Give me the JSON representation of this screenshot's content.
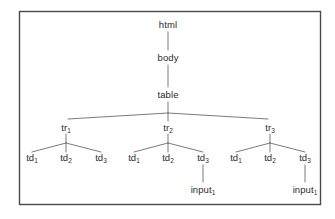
{
  "figure": {
    "type": "dom-tree-diagram",
    "title": "",
    "border_color": "#4a4a4a",
    "line_color": "#6b6b6b",
    "text_color": "#2b2b2b",
    "background": "#ffffff",
    "frame": {
      "x": 19,
      "y": 11,
      "width": 302,
      "height": 194
    }
  },
  "nodes": {
    "html": {
      "text": "html",
      "sub": "",
      "x": 168,
      "y": 25
    },
    "body": {
      "text": "body",
      "sub": "",
      "x": 168,
      "y": 58
    },
    "table": {
      "text": "table",
      "sub": "",
      "x": 168,
      "y": 95
    },
    "tr1": {
      "text": "tr",
      "sub": "1",
      "x": 66,
      "y": 128
    },
    "tr2": {
      "text": "tr",
      "sub": "2",
      "x": 168,
      "y": 128
    },
    "tr3": {
      "text": "tr",
      "sub": "3",
      "x": 270,
      "y": 128
    },
    "td11": {
      "text": "td",
      "sub": "1",
      "x": 32,
      "y": 158
    },
    "td12": {
      "text": "td",
      "sub": "2",
      "x": 66,
      "y": 158
    },
    "td13": {
      "text": "td",
      "sub": "3",
      "x": 101,
      "y": 158
    },
    "td21": {
      "text": "td",
      "sub": "1",
      "x": 134,
      "y": 158
    },
    "td22": {
      "text": "td",
      "sub": "2",
      "x": 168,
      "y": 158
    },
    "td23": {
      "text": "td",
      "sub": "3",
      "x": 203,
      "y": 158
    },
    "td31": {
      "text": "td",
      "sub": "1",
      "x": 236,
      "y": 158
    },
    "td32": {
      "text": "td",
      "sub": "2",
      "x": 270,
      "y": 158
    },
    "td33": {
      "text": "td",
      "sub": "3",
      "x": 305,
      "y": 158
    },
    "input2": {
      "text": "input",
      "sub": "1",
      "x": 203,
      "y": 190
    },
    "input3": {
      "text": "input",
      "sub": "1",
      "x": 305,
      "y": 190
    }
  },
  "edges": [
    {
      "name": "html-to-body",
      "x1": 168,
      "y1": 32,
      "x2": 168,
      "y2": 50
    },
    {
      "name": "body-to-table",
      "x1": 168,
      "y1": 65,
      "x2": 168,
      "y2": 87
    },
    {
      "name": "table-stem",
      "x1": 168,
      "y1": 102,
      "x2": 168,
      "y2": 113
    },
    {
      "name": "table-to-tr1",
      "x1": 168,
      "y1": 113,
      "x2": 68,
      "y2": 119
    },
    {
      "name": "table-to-tr2",
      "x1": 168,
      "y1": 113,
      "x2": 168,
      "y2": 121
    },
    {
      "name": "table-to-tr3",
      "x1": 168,
      "y1": 113,
      "x2": 268,
      "y2": 119
    },
    {
      "name": "tr1-stem",
      "x1": 66,
      "y1": 134,
      "x2": 66,
      "y2": 143
    },
    {
      "name": "tr1-to-td11",
      "x1": 66,
      "y1": 143,
      "x2": 32,
      "y2": 152
    },
    {
      "name": "tr1-to-td12",
      "x1": 66,
      "y1": 143,
      "x2": 66,
      "y2": 152
    },
    {
      "name": "tr1-to-td13",
      "x1": 66,
      "y1": 143,
      "x2": 101,
      "y2": 152
    },
    {
      "name": "tr2-stem",
      "x1": 168,
      "y1": 134,
      "x2": 168,
      "y2": 143
    },
    {
      "name": "tr2-to-td21",
      "x1": 168,
      "y1": 143,
      "x2": 134,
      "y2": 152
    },
    {
      "name": "tr2-to-td22",
      "x1": 168,
      "y1": 143,
      "x2": 168,
      "y2": 152
    },
    {
      "name": "tr2-to-td23",
      "x1": 168,
      "y1": 143,
      "x2": 203,
      "y2": 152
    },
    {
      "name": "tr3-stem",
      "x1": 270,
      "y1": 134,
      "x2": 270,
      "y2": 143
    },
    {
      "name": "tr3-to-td31",
      "x1": 270,
      "y1": 143,
      "x2": 236,
      "y2": 152
    },
    {
      "name": "tr3-to-td32",
      "x1": 270,
      "y1": 143,
      "x2": 270,
      "y2": 152
    },
    {
      "name": "tr3-to-td33",
      "x1": 270,
      "y1": 143,
      "x2": 305,
      "y2": 152
    },
    {
      "name": "td23-to-input2",
      "x1": 203,
      "y1": 165,
      "x2": 203,
      "y2": 182
    },
    {
      "name": "td33-to-input3",
      "x1": 305,
      "y1": 165,
      "x2": 305,
      "y2": 182
    }
  ]
}
